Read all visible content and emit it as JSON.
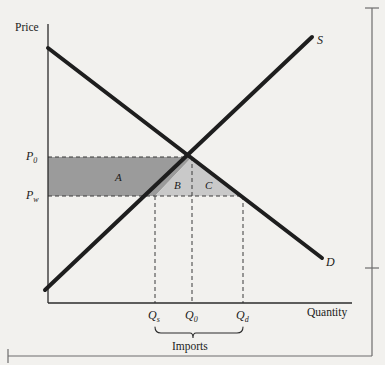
{
  "figure": {
    "kind": "supply-demand-import-diagram",
    "background_color": "#f2f1ee",
    "ink_color": "#1b1b1b",
    "axes": {
      "y_axis_title": "Price",
      "x_axis_title": "Quantity"
    },
    "curves": [
      {
        "id": "supply",
        "label": "S",
        "description": "upward sloping supply curve"
      },
      {
        "id": "demand",
        "label": "D",
        "description": "downward sloping demand curve"
      }
    ],
    "price_ticks": [
      {
        "id": "p0",
        "base": "P",
        "sub": "0",
        "level": "autarky equilibrium price"
      },
      {
        "id": "pw",
        "base": "P",
        "sub": "w",
        "level": "world price"
      }
    ],
    "quantity_ticks": [
      {
        "id": "qs",
        "base": "Q",
        "sub": "s",
        "meaning": "quantity supplied domestically at world price"
      },
      {
        "id": "q0",
        "base": "Q",
        "sub": "0",
        "meaning": "autarky equilibrium quantity"
      },
      {
        "id": "qd",
        "base": "Q",
        "sub": "d",
        "meaning": "quantity demanded at world price"
      }
    ],
    "regions": [
      {
        "id": "a",
        "label": "A",
        "fill": "#999999",
        "shape": "producer surplus loss area"
      },
      {
        "id": "b",
        "label": "B",
        "fill": "#c8c8c8",
        "shape": "deadweight loss triangle left"
      },
      {
        "id": "c",
        "label": "C",
        "fill": "#c8c8c8",
        "shape": "deadweight loss triangle right"
      }
    ],
    "brace": {
      "label": "Imports",
      "spans_from": "Q_s",
      "spans_to": "Q_d"
    },
    "page_rules": {
      "right_rule": true,
      "bottom_rule": true
    }
  }
}
